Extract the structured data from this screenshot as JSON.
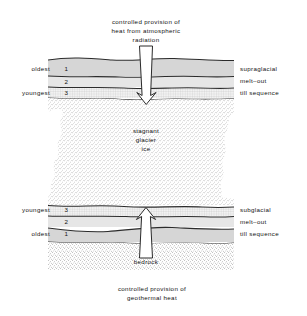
{
  "figure": {
    "top_caption": {
      "line1": "controlled provision of",
      "line2": "heat from atmospheric",
      "line3": "radiation"
    },
    "bottom_caption": {
      "line1": "controlled provision of",
      "line2": "geothermal heat"
    },
    "center_label": {
      "line1": "stagnant",
      "line2": "glacier",
      "line3": "ice"
    },
    "bedrock_label": "bedrock",
    "upper_sequence": {
      "left_labels": [
        {
          "age": "oldest",
          "number": "1"
        },
        {
          "age": "",
          "number": "2"
        },
        {
          "age": "youngest",
          "number": "3"
        }
      ],
      "right_label": {
        "line1": "supraglacial",
        "line2": "melt–out",
        "line3": "till sequence"
      }
    },
    "lower_sequence": {
      "left_labels": [
        {
          "age": "youngest",
          "number": "3"
        },
        {
          "age": "",
          "number": "2"
        },
        {
          "age": "oldest",
          "number": "1"
        }
      ],
      "right_label": {
        "line1": "subglacial",
        "line2": "melt–out",
        "line3": "till sequence"
      }
    },
    "arrows": {
      "top_arrow_name": "downward heat arrow",
      "bottom_arrow_name": "upward heat arrow"
    },
    "colors": {
      "ink": "#2b2b2b",
      "till_gray": "#d4d4d4",
      "till_light": "#e3e3e3",
      "ice_stipple": "#8e8e8e",
      "bedrock_stipple": "#9a9a9a",
      "background": "#ffffff"
    }
  }
}
